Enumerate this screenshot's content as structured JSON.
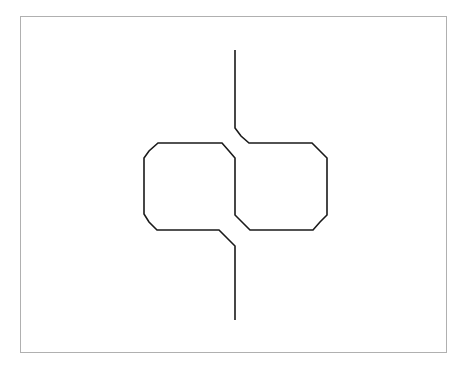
{
  "diagram": {
    "type": "knot-diagram",
    "stroke_color": "#1a1a1a",
    "frame_color": "#b0b0b0",
    "background": "#ffffff",
    "crossings": 2,
    "strands": [
      {
        "name": "top-strand-to-right-loop",
        "points": "235,50 235,128 241,136 249,143 312,143 320,151 327,158 327,215 320,222 313,230 250,230 243,223 235,215 235,158 229,151 222,143 158,143 149,151 144,158 144,214 149,222 157,230 219,230 227,238 235,246 235,320"
      }
    ]
  }
}
